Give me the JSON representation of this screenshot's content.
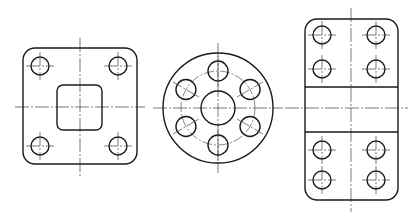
{
  "drawing": {
    "type": "technical-drawing",
    "views": [
      {
        "id": "square-flange",
        "label": "Square flange with square center opening and 4 corner holes",
        "outline": {
          "x": 23,
          "y": 48,
          "w": 114,
          "h": 116,
          "r": 12
        },
        "inner_opening": {
          "x": 57,
          "y": 85,
          "w": 45,
          "h": 45,
          "r": 6
        },
        "center": {
          "x": 80,
          "y": 107
        },
        "hole_radius": 9,
        "holes": [
          [
            40,
            66
          ],
          [
            118,
            66
          ],
          [
            40,
            146
          ],
          [
            118,
            146
          ]
        ]
      },
      {
        "id": "round-flange",
        "label": "Round flange with center bore and 6 holes on bolt circle",
        "center": {
          "x": 218,
          "y": 108
        },
        "outer_radius": 55,
        "bolt_circle_radius": 37,
        "bore_radius": 17,
        "hole_radius": 10,
        "hole_angles_deg": [
          90,
          30,
          -30,
          -90,
          -150,
          150
        ]
      },
      {
        "id": "rectangular-plate",
        "label": "Rectangular plate with center band and 8 holes",
        "outline": {
          "x": 305,
          "y": 19,
          "w": 93,
          "h": 181,
          "r": 12
        },
        "band": {
          "y1": 87,
          "y2": 132
        },
        "center": {
          "x": 351,
          "y": 108
        },
        "hole_radius": 9,
        "holes": [
          [
            322,
            35
          ],
          [
            376,
            35
          ],
          [
            322,
            69
          ],
          [
            376,
            69
          ],
          [
            322,
            150
          ],
          [
            376,
            150
          ],
          [
            322,
            180
          ],
          [
            376,
            180
          ]
        ]
      }
    ],
    "colors": {
      "line": "#1a1a1a",
      "centerline": "#444444",
      "background": "#ffffff"
    }
  }
}
